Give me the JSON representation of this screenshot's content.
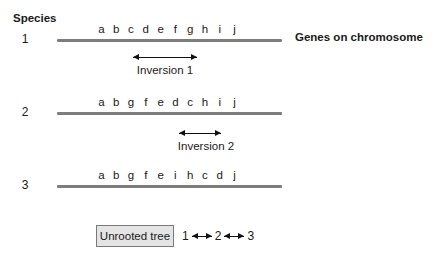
{
  "header": {
    "species_label": "Species",
    "genes_label": "Genes on chromosome"
  },
  "species": [
    {
      "id": "1",
      "genes": [
        "a",
        "b",
        "c",
        "d",
        "e",
        "f",
        "g",
        "h",
        "i",
        "j"
      ]
    },
    {
      "id": "2",
      "genes": [
        "a",
        "b",
        "g",
        "f",
        "e",
        "d",
        "c",
        "h",
        "i",
        "j"
      ]
    },
    {
      "id": "3",
      "genes": [
        "a",
        "b",
        "g",
        "f",
        "e",
        "i",
        "h",
        "c",
        "d",
        "j"
      ]
    }
  ],
  "inversions": [
    {
      "label": "Inversion 1"
    },
    {
      "label": "Inversion 2"
    }
  ],
  "footer": {
    "unrooted_tree_label": "Unrooted tree",
    "tree_nodes": [
      "1",
      "2",
      "3"
    ]
  },
  "colors": {
    "chromosome_line": "#7d7d7d",
    "arrow": "#111111",
    "tree_box_fill": "#e4e4e4",
    "tree_box_border": "#7a7a7a",
    "text": "#1a1a1a",
    "background": "#ffffff"
  }
}
